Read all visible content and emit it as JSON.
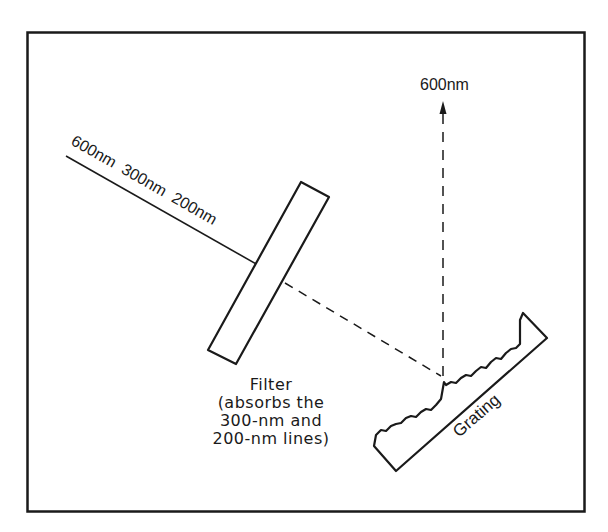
{
  "diagram": {
    "incident_beam_labels": [
      "600nm",
      "300nm",
      "200nm"
    ],
    "incident_beam_text": "600nm  300nm  200nm",
    "output_beam_label": "600nm",
    "filter": {
      "title": "Filter",
      "description_lines": [
        "(absorbs the",
        "300-nm and",
        "200-nm lines)"
      ]
    },
    "grating": {
      "label": "Grating"
    },
    "colors": {
      "stroke": "#1a1a1a",
      "background": "#ffffff"
    }
  }
}
